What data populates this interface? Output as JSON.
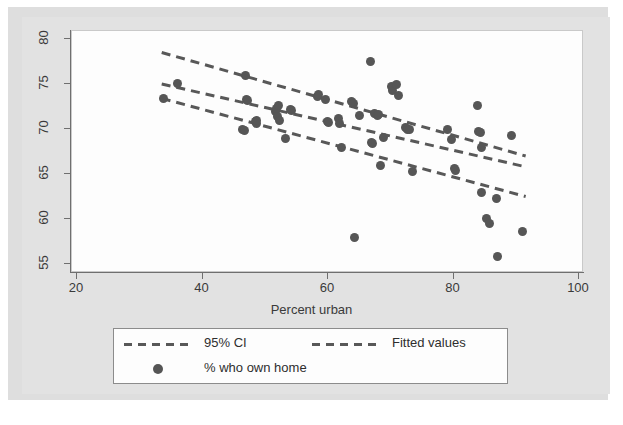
{
  "chart_data": {
    "type": "scatter",
    "title": "",
    "xlabel": "Percent urban",
    "ylabel": "",
    "xlim": [
      20,
      100
    ],
    "ylim": [
      53.5,
      81.5
    ],
    "xticks": [
      20,
      40,
      60,
      80,
      100
    ],
    "yticks": [
      55,
      60,
      65,
      70,
      75,
      80
    ],
    "grid": false,
    "legend_position": "bottom",
    "marker_color": "#565656",
    "line_color": "#585858",
    "background_color": "#dedede",
    "plot_background_color": "#fdfdfd",
    "series": [
      {
        "name": "% who own home",
        "type": "scatter",
        "points": [
          [
            33.8,
            73.4
          ],
          [
            36.0,
            75.1
          ],
          [
            46.8,
            76.0
          ],
          [
            47.0,
            73.3
          ],
          [
            47.2,
            73.2
          ],
          [
            46.4,
            69.9
          ],
          [
            46.7,
            69.8
          ],
          [
            48.4,
            70.8
          ],
          [
            48.6,
            70.6
          ],
          [
            48.6,
            71.0
          ],
          [
            51.7,
            71.9
          ],
          [
            51.8,
            72.3
          ],
          [
            52.0,
            71.4
          ],
          [
            52.1,
            72.6
          ],
          [
            52.3,
            70.9
          ],
          [
            53.3,
            68.9
          ],
          [
            54.0,
            72.2
          ],
          [
            54.2,
            72.1
          ],
          [
            58.3,
            73.6
          ],
          [
            58.5,
            73.8
          ],
          [
            59.6,
            73.3
          ],
          [
            59.9,
            70.8
          ],
          [
            60.1,
            70.7
          ],
          [
            61.6,
            71.2
          ],
          [
            61.8,
            70.6
          ],
          [
            62.2,
            67.9
          ],
          [
            63.8,
            73.1
          ],
          [
            64.0,
            72.8
          ],
          [
            64.2,
            58.0
          ],
          [
            65.0,
            71.5
          ],
          [
            66.8,
            77.5
          ],
          [
            66.9,
            68.5
          ],
          [
            67.1,
            68.4
          ],
          [
            67.4,
            71.7
          ],
          [
            67.9,
            71.5
          ],
          [
            68.0,
            71.6
          ],
          [
            68.3,
            65.9
          ],
          [
            68.9,
            69.1
          ],
          [
            70.1,
            74.7
          ],
          [
            70.2,
            74.3
          ],
          [
            70.9,
            74.9
          ],
          [
            71.2,
            73.7
          ],
          [
            72.4,
            70.2
          ],
          [
            72.6,
            70.0
          ],
          [
            73.0,
            69.9
          ],
          [
            73.4,
            65.3
          ],
          [
            79.0,
            69.9
          ],
          [
            79.7,
            68.8
          ],
          [
            80.1,
            65.6
          ],
          [
            80.3,
            65.4
          ],
          [
            83.9,
            72.6
          ],
          [
            84.0,
            69.7
          ],
          [
            84.3,
            69.6
          ],
          [
            84.4,
            67.9
          ],
          [
            84.4,
            63.0
          ],
          [
            85.3,
            60.1
          ],
          [
            85.7,
            59.5
          ],
          [
            86.9,
            62.3
          ],
          [
            87.0,
            55.8
          ],
          [
            89.2,
            69.3
          ],
          [
            91.0,
            58.6
          ]
        ]
      },
      {
        "name": "Fitted values",
        "type": "line_dashed",
        "points": [
          [
            33.5,
            75.0
          ],
          [
            91.5,
            65.8
          ]
        ]
      },
      {
        "name": "95% CI upper",
        "type": "line_dashed",
        "points": [
          [
            33.5,
            78.5
          ],
          [
            91.5,
            67.0
          ]
        ]
      },
      {
        "name": "95% CI lower",
        "type": "line_dashed",
        "points": [
          [
            33.5,
            73.4
          ],
          [
            91.5,
            62.5
          ]
        ]
      }
    ]
  },
  "axes": {
    "x_title": "Percent urban",
    "x_tick_labels": [
      "20",
      "40",
      "60",
      "80",
      "100"
    ],
    "y_tick_labels": [
      "55",
      "60",
      "65",
      "70",
      "75",
      "80"
    ]
  },
  "legend": {
    "items": [
      {
        "key": "dashed-line",
        "label": "95% CI"
      },
      {
        "key": "dashed-line",
        "label": "Fitted values"
      },
      {
        "key": "dot-marker",
        "label": "% who own home"
      }
    ]
  }
}
